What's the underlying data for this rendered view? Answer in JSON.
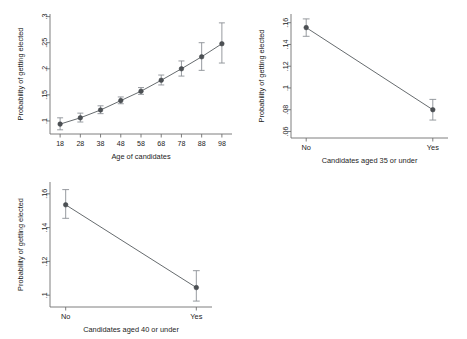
{
  "figure": {
    "background_color": "#ffffff",
    "marker_color": "#4c5054",
    "line_color": "#555a5e",
    "error_bar_color": "#8b9095",
    "axis_color": "#6f6f6f"
  },
  "chart_data": [
    {
      "id": "age-of-candidates",
      "type": "line",
      "title": "",
      "xlabel": "Age of candidates",
      "ylabel": "Probability of getting elected",
      "xlim": [
        13,
        103
      ],
      "ylim": [
        0.075,
        0.305
      ],
      "grid": false,
      "legend": "none",
      "x": [
        18,
        28,
        38,
        48,
        58,
        68,
        78,
        88,
        98
      ],
      "xtick_labels": [
        "18",
        "28",
        "38",
        "48",
        "58",
        "68",
        "78",
        "88",
        "98"
      ],
      "ytick_values": [
        0.1,
        0.15,
        0.2,
        0.25,
        0.3
      ],
      "ytick_labels": [
        ".1",
        ".15",
        ".2",
        ".25",
        ".3"
      ],
      "values": [
        0.094,
        0.106,
        0.121,
        0.139,
        0.157,
        0.178,
        0.2,
        0.223,
        0.248
      ],
      "error_low": [
        0.083,
        0.098,
        0.114,
        0.133,
        0.151,
        0.169,
        0.186,
        0.197,
        0.211
      ],
      "error_high": [
        0.106,
        0.115,
        0.129,
        0.146,
        0.164,
        0.188,
        0.215,
        0.25,
        0.288
      ]
    },
    {
      "id": "aged-35-or-under",
      "type": "line",
      "title": "",
      "xlabel": "Candidates aged 35 or under",
      "ylabel": "Probability of getting elected",
      "xlim": [
        -0.12,
        1.12
      ],
      "ylim": [
        0.054,
        0.168
      ],
      "grid": false,
      "legend": "none",
      "categories": [
        "No",
        "Yes"
      ],
      "xtick_labels": [
        "No",
        "Yes"
      ],
      "ytick_values": [
        0.06,
        0.08,
        0.1,
        0.12,
        0.14,
        0.16
      ],
      "ytick_labels": [
        ".06",
        ".08",
        ".1",
        ".12",
        ".14",
        ".16"
      ],
      "values": [
        0.1555,
        0.08
      ],
      "error_low": [
        0.1475,
        0.0705
      ],
      "error_high": [
        0.1635,
        0.0895
      ]
    },
    {
      "id": "aged-40-or-under",
      "type": "line",
      "title": "",
      "xlabel": "Candidates aged 40 or under",
      "ylabel": "Probability of getting elected",
      "xlim": [
        -0.12,
        1.12
      ],
      "ylim": [
        0.093,
        0.167
      ],
      "grid": false,
      "legend": "none",
      "categories": [
        "No",
        "Yes"
      ],
      "xtick_labels": [
        "No",
        "Yes"
      ],
      "ytick_values": [
        0.1,
        0.12,
        0.14,
        0.16
      ],
      "ytick_labels": [
        ".1",
        ".12",
        ".14",
        ".16"
      ],
      "values": [
        0.1535,
        0.1045
      ],
      "error_low": [
        0.1455,
        0.0965
      ],
      "error_high": [
        0.1625,
        0.1145
      ]
    }
  ]
}
